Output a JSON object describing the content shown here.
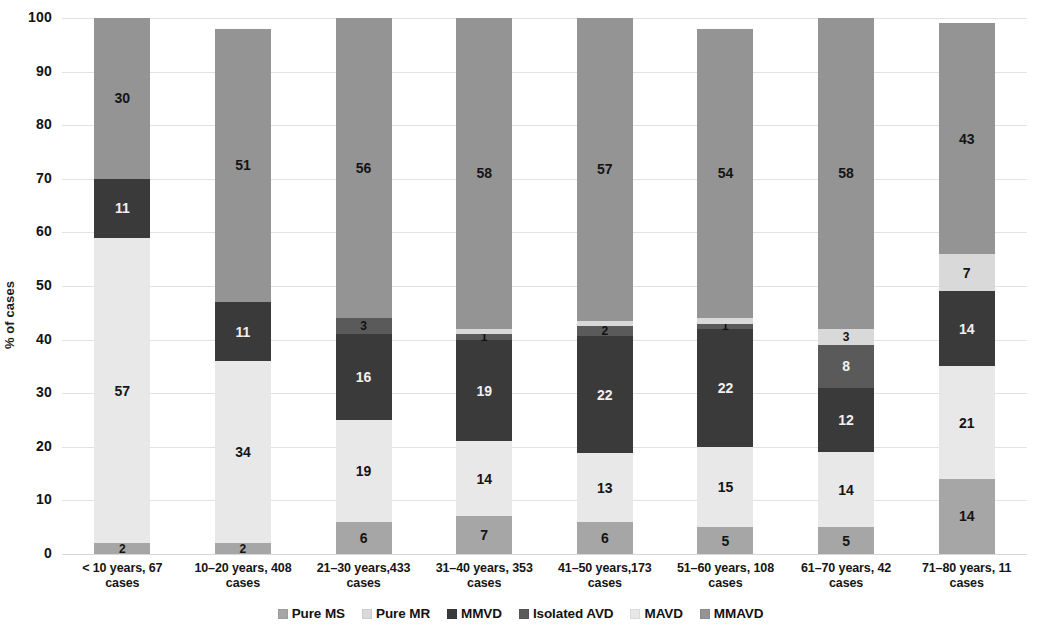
{
  "chart_data": {
    "type": "bar",
    "subtype": "stacked-bar-100-percent",
    "title": "",
    "xlabel": "",
    "ylabel": "% of cases",
    "ylim": [
      0,
      100
    ],
    "yticks": [
      0,
      10,
      20,
      30,
      40,
      50,
      60,
      70,
      80,
      90,
      100
    ],
    "grid": true,
    "legend_position": "bottom",
    "categories": [
      "< 10 years, 67 cases",
      "10–20 years, 408 cases",
      "21–30 years,433 cases",
      "31–40 years, 353 cases",
      "41–50 years,173 cases",
      "51–60 years, 108 cases",
      "61–70 years, 42 cases",
      "71–80 years, 11 cases"
    ],
    "category_lines": [
      [
        "< 10 years, 67",
        "cases"
      ],
      [
        "10–20 years, 408",
        "cases"
      ],
      [
        "21–30 years,433",
        "cases"
      ],
      [
        "31–40 years, 353",
        "cases"
      ],
      [
        "41–50 years,173",
        "cases"
      ],
      [
        "51–60 years, 108",
        "cases"
      ],
      [
        "61–70 years, 42",
        "cases"
      ],
      [
        "71–80 years, 11",
        "cases"
      ]
    ],
    "series": [
      {
        "name": "Pure MS",
        "color": "#a6a6a6",
        "values": [
          2,
          2,
          6,
          7,
          6,
          5,
          5,
          14
        ]
      },
      {
        "name": "Pure MR",
        "color": "#d9d9d9",
        "values": [
          0,
          0,
          0,
          1,
          1,
          1,
          3,
          7
        ]
      },
      {
        "name": "MMVD",
        "color": "#3a3a3a",
        "values": [
          11,
          11,
          16,
          19,
          22,
          22,
          12,
          14
        ]
      },
      {
        "name": "Isolated AVD",
        "color": "#5a5a5a",
        "values": [
          0,
          0,
          3,
          1,
          2,
          1,
          8,
          0
        ]
      },
      {
        "name": "MAVD",
        "color": "#e8e8e8",
        "values": [
          57,
          34,
          19,
          14,
          13,
          15,
          14,
          21
        ]
      },
      {
        "name": "MMAVD",
        "color": "#949494",
        "values": [
          30,
          51,
          56,
          58,
          57,
          54,
          58,
          43
        ]
      }
    ],
    "stack_order_bottom_to_top": [
      "Pure MS",
      "MAVD",
      "MMVD",
      "Isolated AVD",
      "Pure MR",
      "MMAVD"
    ],
    "bars": [
      {
        "category": "< 10 years, 67 cases",
        "segments": [
          {
            "series": "Pure MS",
            "value": 2,
            "label": "2",
            "label_placement": "inside"
          },
          {
            "series": "MAVD",
            "value": 57,
            "label": "57",
            "label_placement": "inside"
          },
          {
            "series": "MMVD",
            "value": 11,
            "label": "11",
            "label_placement": "inside"
          },
          {
            "series": "Isolated AVD",
            "value": 0,
            "label": "",
            "label_placement": "none"
          },
          {
            "series": "Pure MR",
            "value": 0,
            "label": "",
            "label_placement": "none"
          },
          {
            "series": "MMAVD",
            "value": 30,
            "label": "30",
            "label_placement": "inside"
          }
        ]
      },
      {
        "category": "10–20 years, 408 cases",
        "segments": [
          {
            "series": "Pure MS",
            "value": 2,
            "label": "2",
            "label_placement": "inside"
          },
          {
            "series": "MAVD",
            "value": 34,
            "label": "34",
            "label_placement": "inside"
          },
          {
            "series": "MMVD",
            "value": 11,
            "label": "11",
            "label_placement": "inside"
          },
          {
            "series": "Isolated AVD",
            "value": 0,
            "label": "",
            "label_placement": "none"
          },
          {
            "series": "Pure MR",
            "value": 0,
            "label": "0",
            "label_placement": "leader"
          },
          {
            "series": "MMAVD",
            "value": 51,
            "label": "51",
            "label_placement": "inside"
          }
        ]
      },
      {
        "category": "21–30 years,433 cases",
        "segments": [
          {
            "series": "Pure MS",
            "value": 6,
            "label": "6",
            "label_placement": "inside"
          },
          {
            "series": "MAVD",
            "value": 19,
            "label": "19",
            "label_placement": "inside"
          },
          {
            "series": "MMVD",
            "value": 16,
            "label": "16",
            "label_placement": "inside"
          },
          {
            "series": "Isolated AVD",
            "value": 3,
            "label": "3",
            "label_placement": "inside"
          },
          {
            "series": "Pure MR",
            "value": 0,
            "label": "0",
            "label_placement": "above"
          },
          {
            "series": "MMAVD",
            "value": 56,
            "label": "56",
            "label_placement": "inside"
          }
        ]
      },
      {
        "category": "31–40 years, 353 cases",
        "segments": [
          {
            "series": "Pure MS",
            "value": 7,
            "label": "7",
            "label_placement": "inside"
          },
          {
            "series": "MAVD",
            "value": 14,
            "label": "14",
            "label_placement": "inside"
          },
          {
            "series": "MMVD",
            "value": 19,
            "label": "19",
            "label_placement": "inside"
          },
          {
            "series": "Isolated AVD",
            "value": 1,
            "label": "1",
            "label_placement": "inside"
          },
          {
            "series": "Pure MR",
            "value": 1,
            "label": "1",
            "label_placement": "above"
          },
          {
            "series": "MMAVD",
            "value": 58,
            "label": "58",
            "label_placement": "inside"
          }
        ]
      },
      {
        "category": "41–50 years,173 cases",
        "segments": [
          {
            "series": "Pure MS",
            "value": 6,
            "label": "6",
            "label_placement": "inside"
          },
          {
            "series": "MAVD",
            "value": 13,
            "label": "13",
            "label_placement": "inside"
          },
          {
            "series": "MMVD",
            "value": 22,
            "label": "22",
            "label_placement": "inside"
          },
          {
            "series": "Isolated AVD",
            "value": 2,
            "label": "2",
            "label_placement": "inside"
          },
          {
            "series": "Pure MR",
            "value": 1,
            "label": "1",
            "label_placement": "above"
          },
          {
            "series": "MMAVD",
            "value": 57,
            "label": "57",
            "label_placement": "inside"
          }
        ]
      },
      {
        "category": "51–60 years, 108 cases",
        "segments": [
          {
            "series": "Pure MS",
            "value": 5,
            "label": "5",
            "label_placement": "inside"
          },
          {
            "series": "MAVD",
            "value": 15,
            "label": "15",
            "label_placement": "inside"
          },
          {
            "series": "MMVD",
            "value": 22,
            "label": "22",
            "label_placement": "inside"
          },
          {
            "series": "Isolated AVD",
            "value": 1,
            "label": "1",
            "label_placement": "inside"
          },
          {
            "series": "Pure MR",
            "value": 1,
            "label": "1",
            "label_placement": "above"
          },
          {
            "series": "MMAVD",
            "value": 54,
            "label": "54",
            "label_placement": "inside"
          }
        ]
      },
      {
        "category": "61–70 years, 42 cases",
        "segments": [
          {
            "series": "Pure MS",
            "value": 5,
            "label": "5",
            "label_placement": "inside"
          },
          {
            "series": "MAVD",
            "value": 14,
            "label": "14",
            "label_placement": "inside"
          },
          {
            "series": "MMVD",
            "value": 12,
            "label": "12",
            "label_placement": "inside"
          },
          {
            "series": "Isolated AVD",
            "value": 8,
            "label": "8",
            "label_placement": "inside"
          },
          {
            "series": "Pure MR",
            "value": 3,
            "label": "3",
            "label_placement": "inside"
          },
          {
            "series": "MMAVD",
            "value": 58,
            "label": "58",
            "label_placement": "inside"
          }
        ]
      },
      {
        "category": "71–80 years, 11 cases",
        "segments": [
          {
            "series": "Pure MS",
            "value": 14,
            "label": "14",
            "label_placement": "inside"
          },
          {
            "series": "MAVD",
            "value": 21,
            "label": "21",
            "label_placement": "inside"
          },
          {
            "series": "MMVD",
            "value": 14,
            "label": "14",
            "label_placement": "inside"
          },
          {
            "series": "Isolated AVD",
            "value": 0,
            "label": "",
            "label_placement": "none"
          },
          {
            "series": "Pure MR",
            "value": 7,
            "label": "7",
            "label_placement": "inside"
          },
          {
            "series": "MMAVD",
            "value": 43,
            "label": "43",
            "label_placement": "inside"
          }
        ]
      }
    ],
    "legend": [
      {
        "label": "Pure MS",
        "color": "#a6a6a6"
      },
      {
        "label": "Pure MR",
        "color": "#d9d9d9"
      },
      {
        "label": "MMVD",
        "color": "#3a3a3a"
      },
      {
        "label": "Isolated AVD",
        "color": "#5a5a5a"
      },
      {
        "label": "MAVD",
        "color": "#e8e8e8"
      },
      {
        "label": "MMAVD",
        "color": "#949494"
      }
    ]
  }
}
